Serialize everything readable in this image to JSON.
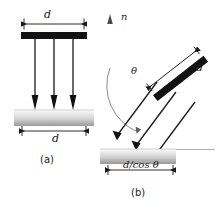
{
  "figure": {
    "background_color": "#ffffff",
    "ink_color": "#1a1a1a",
    "slab_color_light": "#f2f2f2",
    "slab_color_dark": "#9a9a9a",
    "bar_color": "#111111",
    "normal_line_color": "#9e9e9e"
  },
  "panels": [
    {
      "id": "a",
      "caption": "(a)",
      "description": "Normal incidence: beam of width d strikes surface, footprint is d",
      "beam_width_label": "d",
      "footprint_label": "d",
      "ray_count": 3,
      "incidence": "normal"
    },
    {
      "id": "b",
      "caption": "(b)",
      "description": "Oblique incidence: beam of width d strikes surface at angle theta from normal, footprint is d/cos theta",
      "normal_label": "n",
      "angle_label": "θ",
      "beam_width_label": "d",
      "footprint_label": "d/cos θ",
      "ray_count": 3,
      "incidence": "oblique"
    }
  ],
  "labels": {
    "panel_a_beam_width": "d",
    "panel_a_footprint": "d",
    "panel_a_caption": "(a)",
    "panel_b_normal": "n",
    "panel_b_angle": "θ",
    "panel_b_beam_width": "d",
    "panel_b_footprint": "d/cos θ",
    "panel_b_caption": "(b)"
  }
}
